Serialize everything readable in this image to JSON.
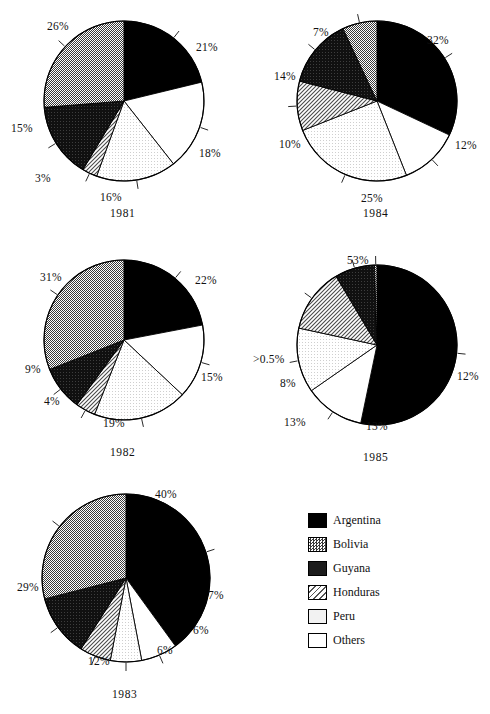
{
  "figure": {
    "width": 490,
    "height": 714,
    "background": "#ffffff"
  },
  "legend": {
    "title": "",
    "items": [
      {
        "label": "Argentina",
        "key": "argentina",
        "color": "#000000",
        "pattern": "solid-black"
      },
      {
        "label": "Bolivia",
        "key": "bolivia",
        "color": "#9a9a9a",
        "pattern": "checker-50"
      },
      {
        "label": "Guyana",
        "key": "guyana",
        "color": "#1c1c1c",
        "pattern": "dense-dark"
      },
      {
        "label": "Honduras",
        "key": "honduras",
        "color": "#cccccc",
        "pattern": "diagonal-hatch"
      },
      {
        "label": "Peru",
        "key": "peru",
        "color": "#f0f0f0",
        "pattern": "very-light"
      },
      {
        "label": "Others",
        "key": "others",
        "color": "#ffffff",
        "pattern": "white"
      }
    ]
  },
  "chart_data": {
    "type": "pie",
    "title": "",
    "legend_position": "bottom-right",
    "category_order": [
      "Argentina",
      "Others",
      "Peru",
      "Honduras",
      "Guyana",
      "Bolivia"
    ],
    "charts": [
      {
        "id": "pie-1981",
        "title": "1981",
        "cx": 124,
        "cy": 101,
        "r": 80,
        "start_angle_deg": 0,
        "direction": "clockwise",
        "slices": [
          {
            "category": "Argentina",
            "value": 21,
            "label": "21%",
            "label_x": 196,
            "label_y": 42,
            "leader": true
          },
          {
            "category": "Others",
            "value": 18,
            "label": "18%",
            "label_x": 199,
            "label_y": 148,
            "leader": true
          },
          {
            "category": "Peru",
            "value": 16,
            "label": "16%",
            "label_x": 100,
            "label_y": 192,
            "leader": true
          },
          {
            "category": "Honduras",
            "value": 3,
            "label": "3%",
            "label_x": 35,
            "label_y": 173,
            "leader": true
          },
          {
            "category": "Guyana",
            "value": 15,
            "label": "15%",
            "label_x": 11,
            "label_y": 123,
            "leader": true
          },
          {
            "category": "Bolivia",
            "value": 26,
            "label": "26%",
            "label_x": 47,
            "label_y": 21,
            "leader": true
          }
        ]
      },
      {
        "id": "pie-1984",
        "title": "1984",
        "cx": 377,
        "cy": 101,
        "r": 80,
        "start_angle_deg": 0,
        "direction": "clockwise",
        "slices": [
          {
            "category": "Argentina",
            "value": 32,
            "label": "32%",
            "label_x": 427,
            "label_y": 35,
            "leader": true
          },
          {
            "category": "Others",
            "value": 12,
            "label": "12%",
            "label_x": 455,
            "label_y": 140,
            "leader": true
          },
          {
            "category": "Peru",
            "value": 25,
            "label": "25%",
            "label_x": 361,
            "label_y": 193,
            "leader": true
          },
          {
            "category": "Honduras",
            "value": 10,
            "label": "10%",
            "label_x": 279,
            "label_y": 139,
            "leader": true
          },
          {
            "category": "Guyana",
            "value": 14,
            "label": "14%",
            "label_x": 274,
            "label_y": 71,
            "leader": true
          },
          {
            "category": "Bolivia",
            "value": 7,
            "label": "7%",
            "label_x": 313,
            "label_y": 27,
            "leader": true
          }
        ]
      },
      {
        "id": "pie-1982",
        "title": "1982",
        "cx": 124,
        "cy": 340,
        "r": 80,
        "start_angle_deg": 0,
        "direction": "clockwise",
        "slices": [
          {
            "category": "Argentina",
            "value": 22,
            "label": "22%",
            "label_x": 195,
            "label_y": 275,
            "leader": true
          },
          {
            "category": "Others",
            "value": 15,
            "label": "15%",
            "label_x": 201,
            "label_y": 372,
            "leader": true
          },
          {
            "category": "Peru",
            "value": 19,
            "label": "19%",
            "label_x": 103,
            "label_y": 418,
            "leader": true
          },
          {
            "category": "Honduras",
            "value": 4,
            "label": "4%",
            "label_x": 44,
            "label_y": 396,
            "leader": true
          },
          {
            "category": "Guyana",
            "value": 9,
            "label": "9%",
            "label_x": 25,
            "label_y": 364,
            "leader": true
          },
          {
            "category": "Bolivia",
            "value": 31,
            "label": "31%",
            "label_x": 40,
            "label_y": 272,
            "leader": true
          }
        ]
      },
      {
        "id": "pie-1985",
        "title": "1985",
        "cx": 377,
        "cy": 345,
        "r": 80,
        "start_angle_deg": 0,
        "direction": "clockwise",
        "slices": [
          {
            "category": "Argentina",
            "value": 53,
            "label": "53%",
            "label_x": 347,
            "label_y": 255,
            "leader": true
          },
          {
            "category": "Others",
            "value": 12,
            "label": "12%",
            "label_x": 457,
            "label_y": 371,
            "leader": true
          },
          {
            "category": "Peru",
            "value": 13,
            "label": "13%",
            "label_x": 366,
            "label_y": 421,
            "leader": true
          },
          {
            "category": "Honduras",
            "value": 13,
            "label": "13%",
            "label_x": 284,
            "label_y": 417,
            "leader": true
          },
          {
            "category": "Guyana",
            "value": 8,
            "label": "8%",
            "label_x": 280,
            "label_y": 378,
            "leader": true
          },
          {
            "category": "Bolivia",
            "value": 0.5,
            "label": ">0.5%",
            "label_x": 253,
            "label_y": 354,
            "leader": true
          }
        ]
      },
      {
        "id": "pie-1983",
        "title": "1983",
        "cx": 126,
        "cy": 578,
        "r": 84,
        "start_angle_deg": 0,
        "direction": "clockwise",
        "slices": [
          {
            "category": "Argentina",
            "value": 40,
            "label": "40%",
            "label_x": 155,
            "label_y": 489,
            "leader": true
          },
          {
            "category": "Others",
            "value": 7,
            "label": "7%",
            "label_x": 208,
            "label_y": 590,
            "leader": true
          },
          {
            "category": "Peru",
            "value": 6,
            "label": "6%",
            "label_x": 193,
            "label_y": 625,
            "leader": true
          },
          {
            "category": "Honduras",
            "value": 6,
            "label": "6%",
            "label_x": 157,
            "label_y": 645,
            "leader": true
          },
          {
            "category": "Guyana",
            "value": 12,
            "label": "12%",
            "label_x": 88,
            "label_y": 656,
            "leader": true
          },
          {
            "category": "Bolivia",
            "value": 29,
            "label": "29%",
            "label_x": 17,
            "label_y": 582,
            "leader": true
          }
        ]
      }
    ]
  }
}
